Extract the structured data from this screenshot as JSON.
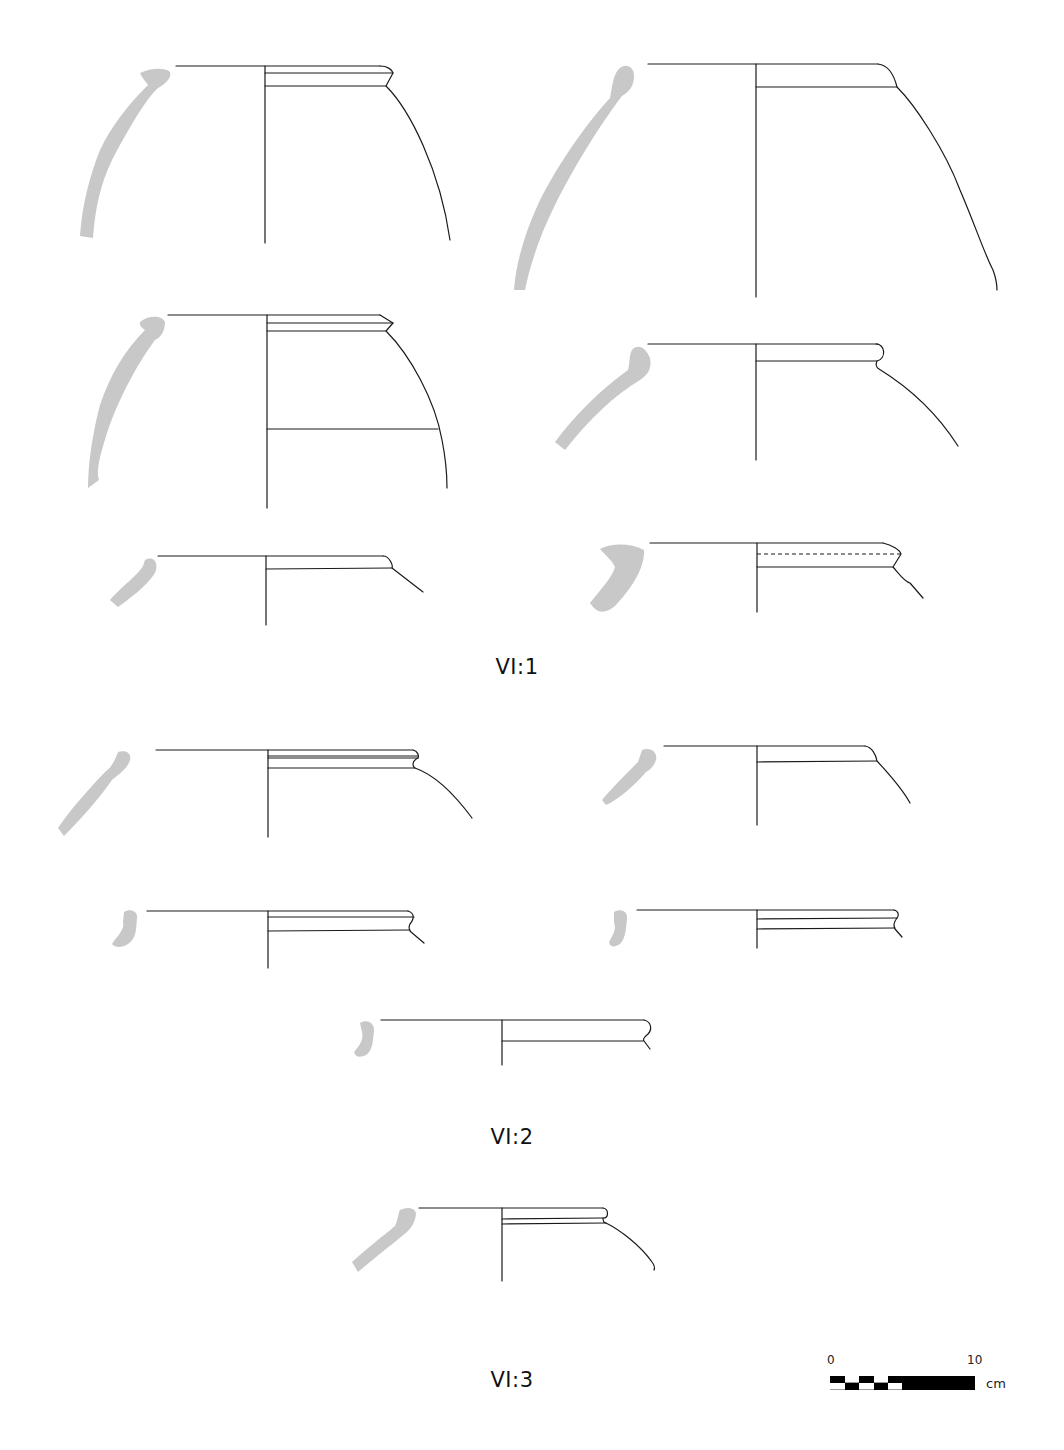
{
  "plate": {
    "groups": [
      {
        "label": "VI:1",
        "vessel_count": 6
      },
      {
        "label": "VI:2",
        "vessel_count": 5
      },
      {
        "label": "VI:3",
        "vessel_count": 1
      }
    ],
    "scale_bar": {
      "start_label": "0",
      "end_label": "10",
      "unit": "cm"
    },
    "colors": {
      "section_fill": "#c8c8c8",
      "line": "#1a1a1a",
      "background": "#ffffff"
    }
  }
}
